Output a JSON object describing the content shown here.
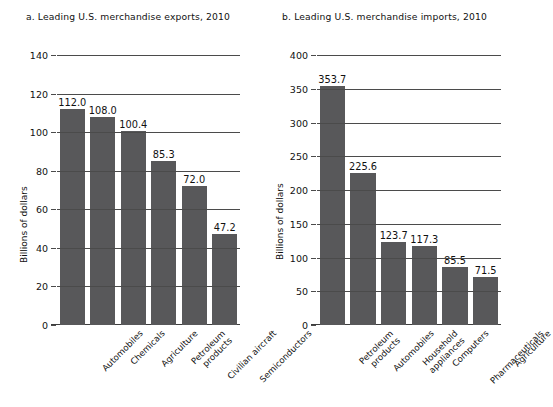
{
  "figure": {
    "bar_color": "#58585a",
    "axis_color": "#4b4b4b",
    "background": "#ffffff"
  },
  "chart_data": [
    {
      "type": "bar",
      "panel": "a",
      "title": "a. Leading U.S. merchandise exports, 2010",
      "xlabel": "",
      "ylabel": "Billions of dollars",
      "ylim": [
        0,
        140
      ],
      "yticks": [
        0,
        20,
        40,
        60,
        80,
        100,
        120,
        140
      ],
      "ytick_labels": [
        "0",
        "20",
        "40",
        "60",
        "80",
        "100",
        "120",
        "140"
      ],
      "grid": true,
      "legend": "none",
      "categories": [
        "Automobiles",
        "Chemicals",
        "Agriculture",
        "Petroleum\nproducts",
        "Civilian aircraft",
        "Semiconductors"
      ],
      "values": [
        112.0,
        108.0,
        100.4,
        85.3,
        72.0,
        47.2
      ],
      "value_labels": [
        "112.0",
        "108.0",
        "100.4",
        "85.3",
        "72.0",
        "47.2"
      ]
    },
    {
      "type": "bar",
      "panel": "b",
      "title": "b. Leading U.S. merchandise imports, 2010",
      "xlabel": "",
      "ylabel": "Billions of dollars",
      "ylim": [
        0,
        400
      ],
      "yticks": [
        0,
        50,
        100,
        150,
        200,
        250,
        300,
        350,
        400
      ],
      "ytick_labels": [
        "0",
        "50",
        "100",
        "150",
        "200",
        "250",
        "300",
        "350",
        "400"
      ],
      "grid": true,
      "legend": "none",
      "categories": [
        "Petroleum\nproducts",
        "Automobiles",
        "Household\nappliances",
        "Computers",
        "Pharmaceuticals",
        "Agriculture"
      ],
      "values": [
        353.7,
        225.6,
        123.7,
        117.3,
        85.5,
        71.5
      ],
      "value_labels": [
        "353.7",
        "225.6",
        "123.7",
        "117.3",
        "85.5",
        "71.5"
      ]
    }
  ]
}
